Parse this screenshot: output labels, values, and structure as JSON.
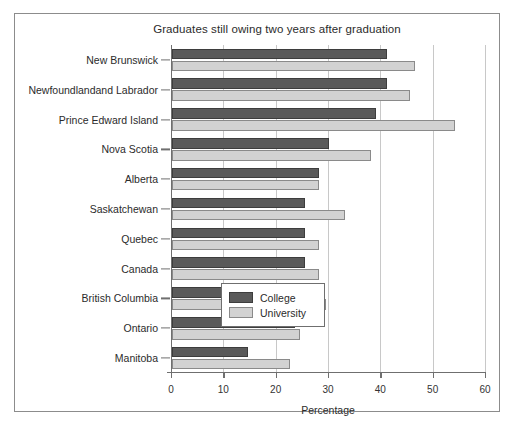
{
  "chart_data": {
    "type": "bar",
    "orientation": "horizontal",
    "title": "Graduates still owing two years after graduation",
    "xlabel": "Percentage",
    "ylabel": "",
    "xlim": [
      0,
      60
    ],
    "xticks": [
      0,
      10,
      20,
      30,
      40,
      50,
      60
    ],
    "grid": true,
    "legend_position": "lower-right-inside",
    "categories": [
      "New Brunswick",
      "Newfoundlandand Labrador",
      "Prince Edward Island",
      "Nova Scotia",
      "Alberta",
      "Saskatchewan",
      "Quebec",
      "Canada",
      "British Columbia",
      "Ontario",
      "Manitoba"
    ],
    "series": [
      {
        "name": "College",
        "color": "#5a5a5a",
        "values": [
          41,
          41,
          39,
          30,
          28,
          25.5,
          25.5,
          25.5,
          23.5,
          23.5,
          14.5
        ]
      },
      {
        "name": "University",
        "color": "#d2d2d2",
        "values": [
          46.5,
          45.5,
          54,
          38,
          28,
          33,
          28,
          28,
          29.5,
          24.5,
          22.5
        ]
      }
    ]
  },
  "legend": {
    "entries": [
      {
        "label": "College",
        "swatch": "college"
      },
      {
        "label": "University",
        "swatch": "university"
      }
    ]
  }
}
